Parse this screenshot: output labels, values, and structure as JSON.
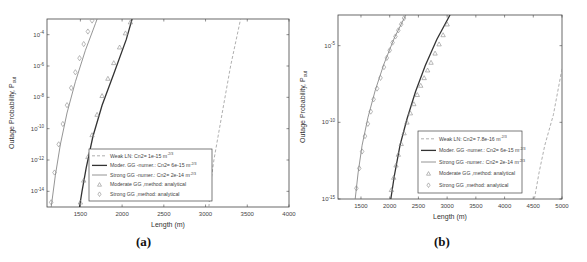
{
  "figure": {
    "panels": [
      {
        "id": "a",
        "caption": "(a)"
      },
      {
        "id": "b",
        "caption": "(b)"
      }
    ]
  },
  "colors": {
    "axes": "#444444",
    "weak_ln": "#9a9a9a",
    "moderate_gg": "#333333",
    "strong_gg": "#7a7a7a",
    "markers": "#8a8a8a"
  },
  "chart_data": [
    {
      "panel": "a",
      "type": "line",
      "title": "",
      "xlabel": "Length (m)",
      "ylabel": "Outage Probability, P_out",
      "xscale": "linear",
      "yscale": "log",
      "xlim": [
        1100,
        4000
      ],
      "ylim_exp": [
        -15,
        -3
      ],
      "xticks": [
        1500,
        2000,
        2500,
        3000,
        3500,
        4000
      ],
      "xtick_labels": [
        "1500",
        "2000",
        "2500",
        "3000",
        "3500",
        "4000"
      ],
      "yticks_exp": [
        -14,
        -12,
        -10,
        -8,
        -6,
        -4
      ],
      "grid": false,
      "legend": {
        "position": "lower-center",
        "entries": [
          {
            "label": "Weak LN: Cn2= 1e-15 m",
            "sup": "-2/3",
            "style": "dashed"
          },
          {
            "label": "Moder. GG -numer.: Cn2= 6e-15 m",
            "sup": "-2/3",
            "style": "solid-thick"
          },
          {
            "label": "Strong GG -numer.: Cn2= 2e-14 m",
            "sup": "-2/3",
            "style": "solid-thin"
          },
          {
            "label": "Moderate GG ,method: analytical",
            "sup": "",
            "style": "triangle"
          },
          {
            "label": "Strong GG ,method: analytical",
            "sup": "",
            "style": "diamond"
          }
        ]
      },
      "series": [
        {
          "name": "Weak LN: Cn2= 1e-15",
          "style": "dashed",
          "x": [
            3040,
            3060,
            3100,
            3200,
            3300,
            3420
          ],
          "y_exp": [
            -15,
            -13.5,
            -12,
            -9,
            -6,
            -3
          ]
        },
        {
          "name": "Moder. GG -numer.: Cn2= 6e-15",
          "style": "solid-thick",
          "x": [
            1490,
            1520,
            1570,
            1650,
            1760,
            1900,
            2050,
            2120
          ],
          "y_exp": [
            -15,
            -14,
            -12.5,
            -10.5,
            -8.5,
            -6.5,
            -4.3,
            -3
          ]
        },
        {
          "name": "Strong GG -numer.: Cn2= 2e-14",
          "style": "solid-thin",
          "x": [
            1150,
            1200,
            1260,
            1340,
            1440,
            1560,
            1680,
            1700
          ],
          "y_exp": [
            -15,
            -13,
            -11,
            -9,
            -7,
            -5,
            -3.3,
            -3
          ]
        },
        {
          "name": "Moderate GG ,method: analytical",
          "style": "triangle",
          "x": [
            1500,
            1540,
            1590,
            1640,
            1700,
            1760,
            1830,
            1900,
            1970,
            2040,
            2100
          ],
          "y_exp": [
            -14.7,
            -13.3,
            -11.8,
            -10.4,
            -9.1,
            -7.9,
            -6.8,
            -5.8,
            -4.8,
            -3.9,
            -3.2
          ]
        },
        {
          "name": "Strong GG ,method: analytical",
          "style": "diamond",
          "x": [
            1150,
            1190,
            1240,
            1290,
            1340,
            1390,
            1440,
            1490,
            1540,
            1590,
            1640
          ],
          "y_exp": [
            -14.7,
            -12.8,
            -11,
            -9.7,
            -8.5,
            -7.4,
            -6.4,
            -5.5,
            -4.6,
            -3.8,
            -3.1
          ]
        }
      ]
    },
    {
      "panel": "b",
      "type": "line",
      "title": "",
      "xlabel": "Length (m)",
      "ylabel": "Outage Probability, P_out",
      "xscale": "linear",
      "yscale": "log",
      "xlim": [
        1100,
        5000
      ],
      "ylim_exp": [
        -15,
        -3
      ],
      "xticks": [
        1500,
        2000,
        2500,
        3000,
        3500,
        4000,
        4500,
        5000
      ],
      "xtick_labels": [
        "1500",
        "2000",
        "2500",
        "3000",
        "3500",
        "4000",
        "4500",
        "5000"
      ],
      "yticks_exp": [
        -15,
        -10,
        -5
      ],
      "grid": false,
      "legend": {
        "position": "lower-right",
        "entries": [
          {
            "label": "Weak LN: Cn2= 7.8e-16 m",
            "sup": "-2/3",
            "style": "dashed"
          },
          {
            "label": "Moder. GG -numer.: Cn2= 6e-15 m",
            "sup": "-2/3",
            "style": "solid-thick"
          },
          {
            "label": "Strong GG -numer.: Cn2= 2e-14 m",
            "sup": "-2/3",
            "style": "solid-thin"
          },
          {
            "label": "Moderate GG ,method: analytical",
            "sup": "",
            "style": "triangle"
          },
          {
            "label": "Strong GG ,method: analytical",
            "sup": "",
            "style": "diamond"
          }
        ]
      },
      "series": [
        {
          "name": "Weak LN: Cn2= 7.8e-16",
          "style": "dashed",
          "x": [
            4520,
            4600,
            4700,
            4850,
            5000
          ],
          "y_exp": [
            -15,
            -13.3,
            -11.5,
            -9.5,
            -6.5
          ]
        },
        {
          "name": "Moder. GG -numer.: Cn2= 6e-15",
          "style": "solid-thick",
          "x": [
            2020,
            2080,
            2180,
            2300,
            2450,
            2620,
            2820,
            3050
          ],
          "y_exp": [
            -15,
            -13.5,
            -11.5,
            -9.8,
            -8,
            -6.3,
            -4.6,
            -3
          ]
        },
        {
          "name": "Strong GG -numer.: Cn2= 2e-14",
          "style": "solid-thin",
          "x": [
            1400,
            1450,
            1520,
            1620,
            1750,
            1900,
            2080,
            2280
          ],
          "y_exp": [
            -15,
            -13.3,
            -11.5,
            -9.7,
            -7.9,
            -6.2,
            -4.5,
            -3
          ]
        },
        {
          "name": "Moderate GG ,method: analytical",
          "style": "triangle",
          "x": [
            2030,
            2070,
            2110,
            2150,
            2200,
            2250,
            2300,
            2360,
            2420,
            2480,
            2540,
            2600,
            2660,
            2720,
            2790,
            2860,
            2930,
            3000
          ],
          "y_exp": [
            -14.4,
            -13.6,
            -12.8,
            -12.1,
            -11.4,
            -10.7,
            -10,
            -9.4,
            -8.8,
            -8.2,
            -7.6,
            -7.1,
            -6.6,
            -6.1,
            -5.5,
            -4.9,
            -4.3,
            -3.6
          ]
        },
        {
          "name": "Strong GG ,method: analytical",
          "style": "diamond",
          "x": [
            1420,
            1470,
            1520,
            1570,
            1620,
            1670,
            1720,
            1780,
            1840,
            1900,
            1950,
            2000,
            2050,
            2100,
            2150,
            2200,
            2250
          ],
          "y_exp": [
            -14.3,
            -13,
            -11.9,
            -10.9,
            -10.1,
            -9.3,
            -8.5,
            -7.8,
            -7.1,
            -6.4,
            -5.8,
            -5.3,
            -4.8,
            -4.4,
            -4,
            -3.6,
            -3.2
          ]
        }
      ]
    }
  ]
}
